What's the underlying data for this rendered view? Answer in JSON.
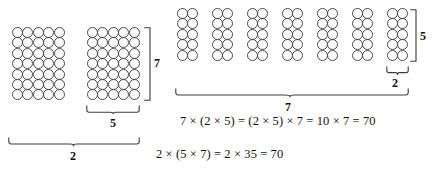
{
  "figure": {
    "background_color": "#ffffff",
    "circle_stroke_color": "#4a4a4a",
    "brace_stroke_color": "#3c3c3c",
    "text_color": "#111111"
  },
  "left_panel": {
    "arrays": [
      {
        "name": "left-array-1",
        "columns": 5,
        "rows": 7,
        "total": 35
      },
      {
        "name": "left-array-2",
        "columns": 5,
        "rows": 7,
        "total": 35
      }
    ],
    "labels": {
      "vertical_rows": "7",
      "horizontal_columns": "5",
      "group_count": "2"
    }
  },
  "right_panel": {
    "groups": 7,
    "group_shape": {
      "columns": 2,
      "rows": 5,
      "total": 10
    },
    "labels": {
      "vertical_rows": "5",
      "horizontal_columns": "2",
      "group_count": "7"
    }
  },
  "equations": {
    "right": "7 × (2 × 5) = (2 × 5) × 7 = 10 × 7 = 70",
    "bottom": "2 × (5 × 7) = 2 × 35 = 70"
  }
}
